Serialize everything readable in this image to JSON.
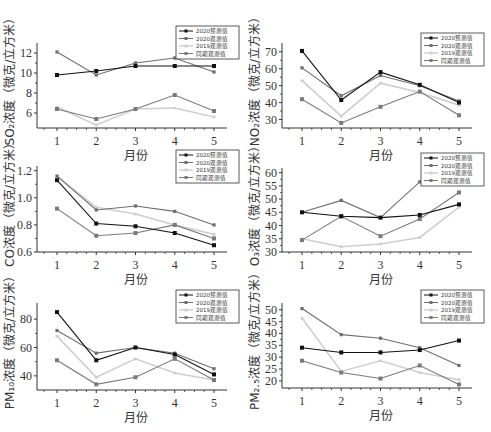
{
  "legend_labels": [
    "2020预测值",
    "2020观测值",
    "2019观测值",
    "同期观测值"
  ],
  "series_colors": [
    "#111111",
    "#6e6e6e",
    "#cfcfcf",
    "#7a7a7a"
  ],
  "chart_data": [
    {
      "id": "so2",
      "type": "line",
      "title": "",
      "xlabel": "月份",
      "ylabel": "SO₂浓度（微克/立方米）",
      "categories": [
        1,
        2,
        3,
        4,
        5
      ],
      "yticks": [
        6,
        8,
        10,
        12
      ],
      "ylim": [
        4.5,
        12.8
      ],
      "grid": false,
      "legend_position": "top-right",
      "series": [
        {
          "name": "2020预测值",
          "values": [
            9.8,
            10.2,
            10.7,
            10.7,
            10.7
          ]
        },
        {
          "name": "2020观测值",
          "values": [
            12.1,
            9.8,
            11.0,
            11.5,
            10.1
          ]
        },
        {
          "name": "2019观测值",
          "values": [
            6.6,
            4.8,
            6.4,
            6.5,
            5.6
          ]
        },
        {
          "name": "同期观测值",
          "values": [
            6.4,
            5.4,
            6.4,
            7.8,
            6.2
          ]
        }
      ]
    },
    {
      "id": "no2",
      "type": "line",
      "title": "",
      "xlabel": "月份",
      "ylabel": "NO₂浓度（微克/立方米）",
      "categories": [
        1,
        2,
        3,
        4,
        5
      ],
      "yticks": [
        30,
        40,
        50,
        60,
        70
      ],
      "ylim": [
        25,
        74
      ],
      "grid": false,
      "legend_position": "top-right",
      "series": [
        {
          "name": "2020预测值",
          "values": [
            70.5,
            41.5,
            58,
            50.5,
            40
          ]
        },
        {
          "name": "2020观测值",
          "values": [
            60.5,
            44,
            56,
            50,
            41
          ]
        },
        {
          "name": "2019观测值",
          "values": [
            53,
            32,
            51.5,
            46,
            38.5
          ]
        },
        {
          "name": "同期观测值",
          "values": [
            42,
            28,
            37.5,
            46.5,
            32.5
          ]
        }
      ]
    },
    {
      "id": "co",
      "type": "line",
      "title": "",
      "xlabel": "月份",
      "ylabel": "CO浓度（微克/立方米）",
      "categories": [
        1,
        2,
        3,
        4,
        5
      ],
      "yticks": [
        0.6,
        0.8,
        1.0,
        1.2
      ],
      "ylim": [
        0.6,
        1.22
      ],
      "grid": false,
      "legend_position": "top-right",
      "series": [
        {
          "name": "2020预测值",
          "values": [
            1.13,
            0.81,
            0.79,
            0.74,
            0.65
          ]
        },
        {
          "name": "2020观测值",
          "values": [
            1.16,
            0.91,
            0.94,
            0.9,
            0.8
          ]
        },
        {
          "name": "2019观测值",
          "values": [
            1.16,
            0.93,
            0.88,
            0.8,
            0.73
          ]
        },
        {
          "name": "同期观测值",
          "values": [
            0.92,
            0.72,
            0.74,
            0.8,
            0.7
          ]
        }
      ]
    },
    {
      "id": "o3",
      "type": "line",
      "title": "",
      "xlabel": "月份",
      "ylabel": "O₃浓度（微克/立方米）",
      "categories": [
        1,
        2,
        3,
        4,
        5
      ],
      "yticks": [
        30,
        35,
        40,
        45,
        50,
        55,
        60
      ],
      "ylim": [
        30,
        61
      ],
      "grid": false,
      "legend_position": "top-right",
      "series": [
        {
          "name": "2020预测值",
          "values": [
            45,
            43.5,
            43,
            44,
            48
          ]
        },
        {
          "name": "2020观测值",
          "values": [
            45,
            49.5,
            43,
            56.5,
            59
          ]
        },
        {
          "name": "2019观测值",
          "values": [
            35,
            32,
            33,
            35.5,
            47
          ]
        },
        {
          "name": "同期观测值",
          "values": [
            34.5,
            43.5,
            36,
            42.5,
            52.5
          ]
        }
      ]
    },
    {
      "id": "pm10",
      "type": "line",
      "title": "",
      "xlabel": "月份",
      "ylabel": "PM₁₀浓度（微克/立方米）",
      "categories": [
        1,
        2,
        3,
        4,
        5
      ],
      "yticks": [
        40,
        60,
        80
      ],
      "ylim": [
        30,
        90
      ],
      "grid": false,
      "legend_position": "top-right",
      "series": [
        {
          "name": "2020预测值",
          "values": [
            85,
            51,
            60,
            55,
            41
          ]
        },
        {
          "name": "2020观测值",
          "values": [
            72,
            56,
            60,
            56,
            45
          ]
        },
        {
          "name": "2019观测值",
          "values": [
            68,
            39,
            52,
            42,
            37
          ]
        },
        {
          "name": "同期观测值",
          "values": [
            51,
            34,
            39,
            52,
            37
          ]
        }
      ]
    },
    {
      "id": "pm25",
      "type": "line",
      "title": "",
      "xlabel": "月份",
      "ylabel": "PM₂.₅浓度（微克/立方米）",
      "categories": [
        1,
        2,
        3,
        4,
        5
      ],
      "yticks": [
        20,
        25,
        30,
        35,
        40,
        45,
        50
      ],
      "ylim": [
        17,
        52
      ],
      "grid": false,
      "legend_position": "top-right",
      "series": [
        {
          "name": "2020预测值",
          "values": [
            34,
            32,
            32,
            33,
            37
          ]
        },
        {
          "name": "2020观测值",
          "values": [
            50.5,
            39.5,
            38,
            34,
            26.5
          ]
        },
        {
          "name": "2019观测值",
          "values": [
            46.5,
            24,
            28.5,
            23.5,
            20.5
          ]
        },
        {
          "name": "同期观测值",
          "values": [
            28.5,
            23.5,
            21,
            26.5,
            18.5
          ]
        }
      ]
    }
  ],
  "layout": [
    {
      "left": 0,
      "top": 0,
      "axis_top": 45,
      "axis_bottom": 128,
      "legend_top": 26
    },
    {
      "left": 245,
      "top": 0,
      "axis_top": 45,
      "axis_bottom": 128,
      "legend_top": 33
    },
    {
      "left": 0,
      "top": 140,
      "axis_top": 28,
      "axis_bottom": 112,
      "legend_top": 10
    },
    {
      "left": 245,
      "top": 140,
      "axis_top": 30,
      "axis_bottom": 112,
      "legend_top": 13
    },
    {
      "left": 0,
      "top": 280,
      "axis_top": 25,
      "axis_bottom": 110,
      "legend_top": 10
    },
    {
      "left": 245,
      "top": 280,
      "axis_top": 25,
      "axis_bottom": 108,
      "legend_top": 10
    }
  ]
}
